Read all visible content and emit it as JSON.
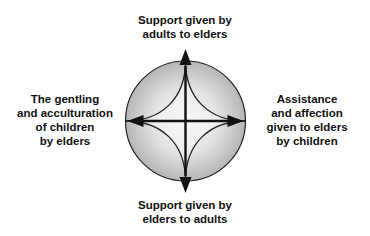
{
  "diagram": {
    "type": "circular-exchange-diagram",
    "colors": {
      "background": "#ffffff",
      "circle_fill_center": "#f7f7f7",
      "circle_fill_edge": "#b8b8b8",
      "stroke": "#111111",
      "text": "#111111"
    },
    "labels": {
      "top": {
        "lines": [
          "Support given by",
          "adults to elders"
        ]
      },
      "bottom": {
        "lines": [
          "Support given by",
          "elders to adults"
        ]
      },
      "left": {
        "lines": [
          "The gentling",
          "and acculturation",
          "of children",
          "by elders"
        ]
      },
      "right": {
        "lines": [
          "Assistance",
          "and affection",
          "given to elders",
          "by children"
        ]
      }
    },
    "arrows": [
      {
        "direction": "up",
        "icon": "arrowhead-up-icon"
      },
      {
        "direction": "down",
        "icon": "arrowhead-down-icon"
      },
      {
        "direction": "left",
        "icon": "arrowhead-left-icon"
      },
      {
        "direction": "right",
        "icon": "arrowhead-right-icon"
      }
    ]
  }
}
